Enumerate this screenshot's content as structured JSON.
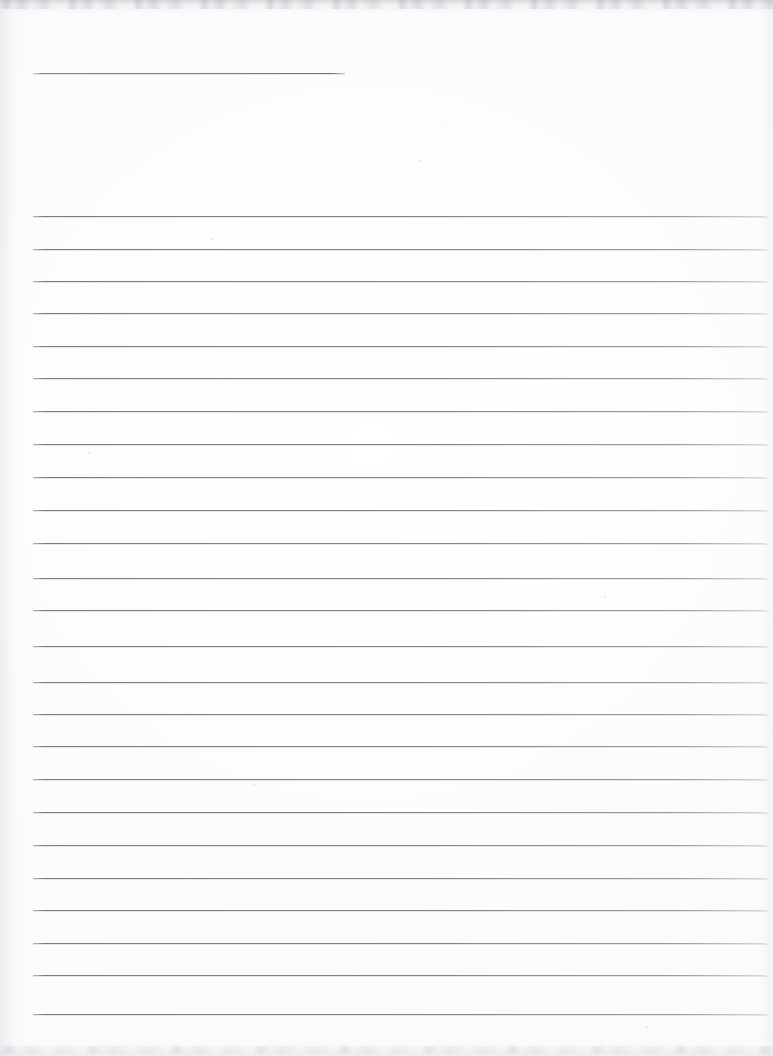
{
  "document": {
    "kind": "scanned-lined-paper",
    "title": "Blank Ruled Notebook Page",
    "width_px": 773,
    "height_px": 1056,
    "orientation": "portrait",
    "content_text": "",
    "handwriting_present": "no",
    "page_number_visible": "",
    "background_color": "#fdfdfd",
    "rule_color": "#76767e",
    "rule_secondary_color": "#afafb9",
    "edge_shadow_color": "#aaacb4",
    "left_margin_line_present": "no"
  },
  "header_rule": {
    "name": "short top rule",
    "x": 33,
    "y": 73,
    "width": 312,
    "thickness_px": 1
  },
  "ruled_area": {
    "left_x": 33,
    "right_x": 768,
    "width": 735,
    "first_line_y": 216,
    "last_line_y": 1014,
    "line_count": 25,
    "average_spacing_px": 33,
    "thickness_px": 1,
    "line_y_positions": [
      216,
      249,
      281,
      313,
      346,
      378,
      411,
      444,
      477,
      510,
      543,
      578,
      610,
      646,
      682,
      714,
      746,
      779,
      812,
      845,
      878,
      910,
      943,
      975,
      1014
    ]
  },
  "artifacts": {
    "top_band": {
      "y": 0,
      "height": 14,
      "label": "top scan shadow band"
    },
    "bottom_band": {
      "y": 1034,
      "height": 22,
      "label": "bottom scan shadow band"
    },
    "left_gutter": {
      "x": 0,
      "width": 26,
      "label": "left edge gray tint"
    },
    "right_gutter": {
      "x": 759,
      "width": 14,
      "label": "right edge gray tint"
    },
    "specks": [
      {
        "x": 419,
        "y": 160,
        "size": 2
      },
      {
        "x": 211,
        "y": 238,
        "size": 2
      },
      {
        "x": 496,
        "y": 244,
        "size": 1
      },
      {
        "x": 716,
        "y": 271,
        "size": 2
      },
      {
        "x": 142,
        "y": 366,
        "size": 1
      },
      {
        "x": 88,
        "y": 452,
        "size": 2
      },
      {
        "x": 328,
        "y": 520,
        "size": 1
      },
      {
        "x": 604,
        "y": 596,
        "size": 2
      },
      {
        "x": 162,
        "y": 648,
        "size": 1
      },
      {
        "x": 683,
        "y": 720,
        "size": 1
      },
      {
        "x": 253,
        "y": 784,
        "size": 2
      },
      {
        "x": 529,
        "y": 860,
        "size": 1
      },
      {
        "x": 96,
        "y": 926,
        "size": 1
      },
      {
        "x": 646,
        "y": 1026,
        "size": 2
      },
      {
        "x": 309,
        "y": 1042,
        "size": 1
      }
    ]
  }
}
